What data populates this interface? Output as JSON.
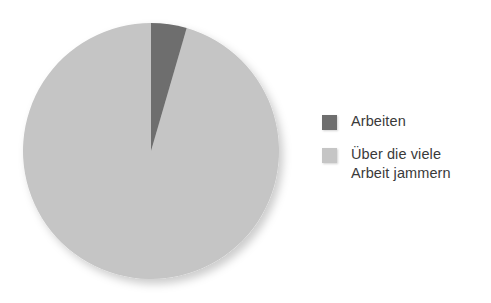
{
  "chart_data": {
    "type": "pie",
    "title": "",
    "subtitle": "",
    "xlabel": "",
    "ylabel": "",
    "grid": false,
    "legend_position": "right",
    "start_angle_deg": 0,
    "direction": "clockwise",
    "categories": [
      "Arbeiten",
      "Über die viele\nArbeit jammern"
    ],
    "values": [
      4.5,
      95.5
    ],
    "slices": [
      {
        "label": "Arbeiten",
        "value": 4.5,
        "percent": "4.5%",
        "color": "#6e6e6e",
        "start_angle_deg": 0,
        "end_angle_deg": 16.2
      },
      {
        "label": "Über die viele\nArbeit jammern",
        "value": 95.5,
        "percent": "95.5%",
        "color": "#c5c5c5",
        "start_angle_deg": 16.2,
        "end_angle_deg": 360
      }
    ],
    "annotations": []
  },
  "geometry": {
    "center_x": 151,
    "center_y": 151,
    "radius": 128
  },
  "legend": {
    "items": [
      {
        "label": "Arbeiten",
        "color": "#6e6e6e",
        "swatch_name": "legend-swatch-arbeiten"
      },
      {
        "label": "Über die viele\nArbeit jammern",
        "color": "#c5c5c5",
        "swatch_name": "legend-swatch-jammern"
      }
    ]
  },
  "colors": {
    "background": "#ffffff",
    "slice_dark": "#6e6e6e",
    "slice_light": "#c5c5c5",
    "text": "#3a3a3a"
  }
}
